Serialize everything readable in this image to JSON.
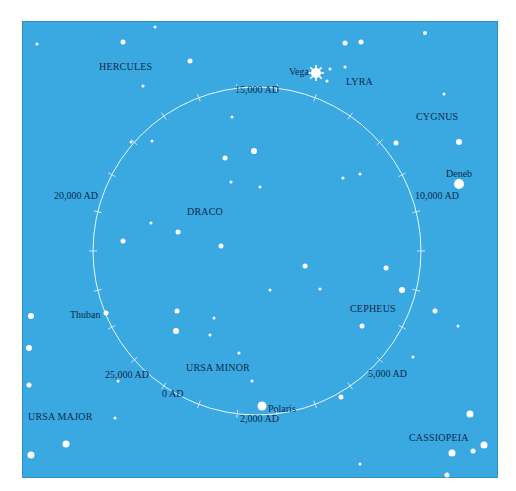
{
  "map": {
    "background": "#3aa9e2",
    "label_color": "#0e2a4a",
    "star_color": "#ffffff"
  },
  "constellations": [
    {
      "name": "HERCULES",
      "x": 99,
      "y": 62
    },
    {
      "name": "LYRA",
      "x": 346,
      "y": 77
    },
    {
      "name": "CYGNUS",
      "x": 416,
      "y": 112
    },
    {
      "name": "DRACO",
      "x": 187,
      "y": 207
    },
    {
      "name": "CEPHEUS",
      "x": 350,
      "y": 304
    },
    {
      "name": "URSA MINOR",
      "x": 186,
      "y": 363
    },
    {
      "name": "URSA MAJOR",
      "x": 28,
      "y": 412
    },
    {
      "name": "CASSIOPEIA",
      "x": 409,
      "y": 433
    }
  ],
  "named_stars": [
    {
      "name": "Vega",
      "label_x": 289,
      "label_y": 67,
      "x": 316,
      "y": 73,
      "r": 5,
      "burst": true
    },
    {
      "name": "Deneb",
      "label_x": 446,
      "label_y": 169,
      "x": 459,
      "y": 184,
      "r": 5
    },
    {
      "name": "Thuban",
      "label_x": 70,
      "label_y": 310,
      "x": 106,
      "y": 313,
      "r": 2.5
    },
    {
      "name": "Polaris",
      "label_x": 268,
      "label_y": 404,
      "x": 262,
      "y": 406,
      "r": 4.5
    }
  ],
  "epochs": [
    {
      "label": "15,000 AD",
      "x": 235,
      "y": 85
    },
    {
      "label": "10,000 AD",
      "x": 415,
      "y": 191
    },
    {
      "label": "20,000 AD",
      "x": 54,
      "y": 191
    },
    {
      "label": "5,000 AD",
      "x": 368,
      "y": 369
    },
    {
      "label": "25,000 AD",
      "x": 105,
      "y": 370
    },
    {
      "label": "0 AD",
      "x": 162,
      "y": 389
    },
    {
      "label": "2,000 AD",
      "x": 240,
      "y": 414
    }
  ],
  "precession_circle": {
    "cx": 257,
    "cy": 251,
    "r": 164,
    "ticks": 26
  },
  "stars": [
    {
      "x": 37,
      "y": 44,
      "r": 1.5
    },
    {
      "x": 155,
      "y": 27,
      "r": 1.5
    },
    {
      "x": 123,
      "y": 42,
      "r": 2.5
    },
    {
      "x": 190,
      "y": 61,
      "r": 2.5
    },
    {
      "x": 143,
      "y": 86,
      "r": 1.5
    },
    {
      "x": 345,
      "y": 43,
      "r": 2.5
    },
    {
      "x": 361,
      "y": 42,
      "r": 2.5
    },
    {
      "x": 425,
      "y": 33,
      "r": 2
    },
    {
      "x": 330,
      "y": 69,
      "r": 1.5
    },
    {
      "x": 327,
      "y": 81,
      "r": 1.5
    },
    {
      "x": 345,
      "y": 67,
      "r": 1.5
    },
    {
      "x": 444,
      "y": 94,
      "r": 1.5
    },
    {
      "x": 459,
      "y": 142,
      "r": 3
    },
    {
      "x": 396,
      "y": 143,
      "r": 2.5
    },
    {
      "x": 232,
      "y": 117,
      "r": 1.5
    },
    {
      "x": 254,
      "y": 151,
      "r": 3
    },
    {
      "x": 225,
      "y": 158,
      "r": 2.5
    },
    {
      "x": 231,
      "y": 182,
      "r": 1.5
    },
    {
      "x": 260,
      "y": 187,
      "r": 1.5
    },
    {
      "x": 152,
      "y": 141,
      "r": 1.5
    },
    {
      "x": 131,
      "y": 142,
      "r": 1.5
    },
    {
      "x": 343,
      "y": 178,
      "r": 1.5
    },
    {
      "x": 360,
      "y": 174,
      "r": 1.5
    },
    {
      "x": 151,
      "y": 223,
      "r": 1.5
    },
    {
      "x": 178,
      "y": 232,
      "r": 2.5
    },
    {
      "x": 123,
      "y": 241,
      "r": 2.5
    },
    {
      "x": 221,
      "y": 246,
      "r": 2.5
    },
    {
      "x": 305,
      "y": 266,
      "r": 2.5
    },
    {
      "x": 386,
      "y": 268,
      "r": 2.5
    },
    {
      "x": 270,
      "y": 290,
      "r": 1.5
    },
    {
      "x": 320,
      "y": 289,
      "r": 1.5
    },
    {
      "x": 402,
      "y": 290,
      "r": 3
    },
    {
      "x": 435,
      "y": 311,
      "r": 2.5
    },
    {
      "x": 458,
      "y": 326,
      "r": 1.5
    },
    {
      "x": 177,
      "y": 311,
      "r": 2.5
    },
    {
      "x": 214,
      "y": 318,
      "r": 1.5
    },
    {
      "x": 176,
      "y": 331,
      "r": 3
    },
    {
      "x": 210,
      "y": 335,
      "r": 1.5
    },
    {
      "x": 239,
      "y": 353,
      "r": 1.5
    },
    {
      "x": 252,
      "y": 381,
      "r": 1.5
    },
    {
      "x": 362,
      "y": 326,
      "r": 2.5
    },
    {
      "x": 413,
      "y": 357,
      "r": 1.5
    },
    {
      "x": 341,
      "y": 397,
      "r": 2.5
    },
    {
      "x": 118,
      "y": 381,
      "r": 1.5
    },
    {
      "x": 115,
      "y": 418,
      "r": 1.5
    },
    {
      "x": 31,
      "y": 316,
      "r": 3
    },
    {
      "x": 29,
      "y": 348,
      "r": 3
    },
    {
      "x": 29,
      "y": 385,
      "r": 2.5
    },
    {
      "x": 66,
      "y": 444,
      "r": 3.5
    },
    {
      "x": 31,
      "y": 455,
      "r": 3.5
    },
    {
      "x": 470,
      "y": 414,
      "r": 3.5
    },
    {
      "x": 452,
      "y": 453,
      "r": 3.5
    },
    {
      "x": 473,
      "y": 451,
      "r": 2.5
    },
    {
      "x": 484,
      "y": 445,
      "r": 3.5
    },
    {
      "x": 360,
      "y": 464,
      "r": 1.5
    },
    {
      "x": 447,
      "y": 475,
      "r": 2.5
    }
  ]
}
